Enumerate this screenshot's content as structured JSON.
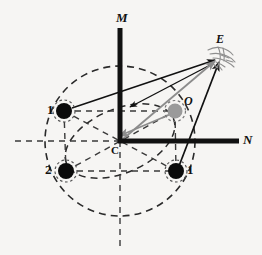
{
  "figure": {
    "background_color": "#f6f5f3",
    "ink_color": "#111111",
    "grey_color": "#8c8c8c",
    "dash_color": "#333333"
  },
  "axes": {
    "vertical": {
      "label": "M",
      "name": "m-axis",
      "x": 120,
      "y_top": 28,
      "y_bottom": 141,
      "thickness": 5,
      "color": "#111111"
    },
    "horizontal": {
      "label": "N",
      "name": "n-axis",
      "y": 141,
      "x_left": 120,
      "x_right": 239,
      "thickness": 5,
      "color": "#111111"
    },
    "origin": {
      "label": "C",
      "x": 120,
      "y": 141
    }
  },
  "labels": {
    "m": "M",
    "n": "N",
    "c": "C",
    "o": "O",
    "e": "E",
    "point_left": "1",
    "point_bottom_left": "2",
    "point_bottom_right": "1"
  },
  "points": [
    {
      "id": "p-left-1",
      "label": "1",
      "x": 64,
      "y": 111,
      "r": 8,
      "fill": "#0b0b0b",
      "halo": true,
      "label_dx": -15,
      "label_dy": -7
    },
    {
      "id": "p-bottom-left-2",
      "label": "2",
      "x": 66,
      "y": 171,
      "r": 8,
      "fill": "#0b0b0b",
      "halo": true,
      "label_dx": -17,
      "label_dy": -7
    },
    {
      "id": "p-bottom-right-1",
      "label": "1",
      "x": 176,
      "y": 171,
      "r": 8,
      "fill": "#0b0b0b",
      "halo": true,
      "label_dx": 10,
      "label_dy": -7
    },
    {
      "id": "p-observed-o",
      "label": "O",
      "x": 175,
      "y": 111,
      "r": 7.5,
      "fill": "#9a9a9a",
      "halo": true,
      "label_dx": 9,
      "label_dy": -19
    }
  ],
  "observer": {
    "id": "observer-e",
    "label": "E",
    "x": 221,
    "y": 57,
    "label_dx": -5,
    "label_dy": -21,
    "sketch_color": "#8e8e8e"
  },
  "circles": [
    {
      "id": "outer-dashed-circle",
      "cx": 120,
      "cy": 141,
      "r": 75,
      "rotation": 0,
      "stroke": "#2a2a2a",
      "dash": "7 5"
    },
    {
      "id": "inner-dashed-ellipse",
      "cx": 120,
      "cy": 141,
      "rx": 58,
      "ry": 32,
      "rotation": -23,
      "stroke": "#2a2a2a",
      "dash": "7 5"
    }
  ],
  "guide_lines": [
    {
      "id": "guide-horizontal-mid",
      "x1": 15,
      "y1": 141,
      "x2": 120,
      "y2": 141
    },
    {
      "id": "guide-vertical-bottom",
      "x1": 120,
      "y1": 141,
      "x2": 120,
      "y2": 246
    },
    {
      "id": "guide-row-upper",
      "x1": 64,
      "y1": 111,
      "x2": 175,
      "y2": 111
    },
    {
      "id": "guide-row-lower",
      "x1": 66,
      "y1": 171,
      "x2": 176,
      "y2": 171
    },
    {
      "id": "guide-col-left",
      "x1": 64,
      "y1": 111,
      "x2": 66,
      "y2": 171
    },
    {
      "id": "guide-col-right",
      "x1": 175,
      "y1": 111,
      "x2": 176,
      "y2": 171
    },
    {
      "id": "guide-diag-1",
      "x1": 66,
      "y1": 171,
      "x2": 175,
      "y2": 111
    },
    {
      "id": "guide-diag-2",
      "x1": 64,
      "y1": 111,
      "x2": 176,
      "y2": 171
    }
  ],
  "sight_lines": [
    {
      "id": "ray-p1left-to-e",
      "from": "p-left-1",
      "x1": 72,
      "y1": 108,
      "x2": 217,
      "y2": 60,
      "color": "#111111",
      "width": 1.4,
      "arrow": "end"
    },
    {
      "id": "ray-e-to-p1left",
      "from": "observer-e",
      "x1": 215,
      "y1": 63,
      "x2": 128,
      "y2": 107,
      "color": "#111111",
      "width": 1.3,
      "arrow": "end"
    },
    {
      "id": "ray-c-to-e",
      "from": "origin-c",
      "x1": 122,
      "y1": 139,
      "x2": 216,
      "y2": 60,
      "color": "#8c8c8c",
      "width": 1.6,
      "arrow": "end"
    },
    {
      "id": "ray-o-to-c",
      "from": "p-observed-o",
      "x1": 172,
      "y1": 114,
      "x2": 120,
      "y2": 136,
      "color": "#8c8c8c",
      "width": 1.6,
      "arrow": "end"
    },
    {
      "id": "ray-p1right-to-e",
      "from": "p-bottom-right-1",
      "x1": 178,
      "y1": 167,
      "x2": 219,
      "y2": 62,
      "color": "#111111",
      "width": 1.6,
      "arrow": "end"
    }
  ],
  "annotation": {
    "description": "Dashed circle with four marked positions (1, 2, 1) around centre C, point O, and observer E at upper right; arrows indicate lines of sight."
  }
}
